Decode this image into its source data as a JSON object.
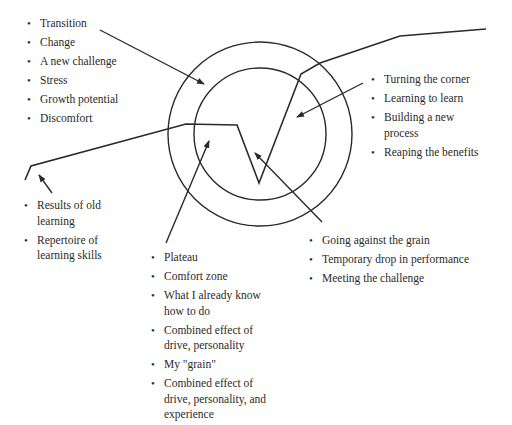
{
  "diagram": {
    "colors": {
      "line": "#2a2a2a",
      "text": "#2a2a2a",
      "background": "#ffffff"
    },
    "circles": {
      "center": [
        260,
        134
      ],
      "outer_radius": 92,
      "inner_radius": 66
    },
    "lists": {
      "top_left": {
        "items": [
          "Transition",
          "Change",
          "A new challenge",
          "Stress",
          "Growth potential",
          "Discomfort"
        ]
      },
      "top_right": {
        "items": [
          "Turning the corner",
          "Learning to learn",
          "Building a new process",
          "Reaping the benefits"
        ]
      },
      "left": {
        "items": [
          "Results of old learning",
          "Repertoire of learning skills"
        ]
      },
      "bottom_center": {
        "items": [
          "Plateau",
          "Comfort zone",
          "What I already know how to do",
          "Combined effect of drive, personality",
          "My \"grain\"",
          "Combined effect of drive, personality, and experience"
        ]
      },
      "bottom_right": {
        "items": [
          "Going against the grain",
          "Temporary drop in performance",
          "Meeting the challenge"
        ]
      }
    }
  }
}
